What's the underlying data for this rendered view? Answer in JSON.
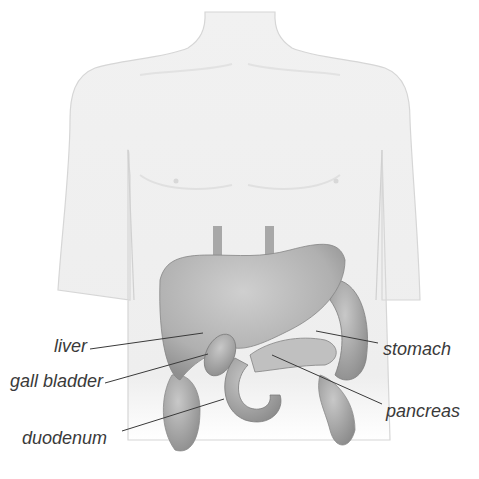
{
  "diagram": {
    "colors": {
      "background": "#ffffff",
      "skin_outline": "#c9c9c9",
      "organ_fill": "#b5b5b5",
      "organ_shadow": "#8e8e8e",
      "leader_line": "#3a3a3a",
      "label_text": "#3a3a3a"
    },
    "labels": [
      {
        "id": "liver",
        "text": "liver",
        "side": "left"
      },
      {
        "id": "gall_bladder",
        "text": "gall bladder",
        "side": "left"
      },
      {
        "id": "duodenum",
        "text": "duodenum",
        "side": "left"
      },
      {
        "id": "stomach",
        "text": "stomach",
        "side": "right"
      },
      {
        "id": "pancreas",
        "text": "pancreas",
        "side": "right"
      }
    ]
  }
}
